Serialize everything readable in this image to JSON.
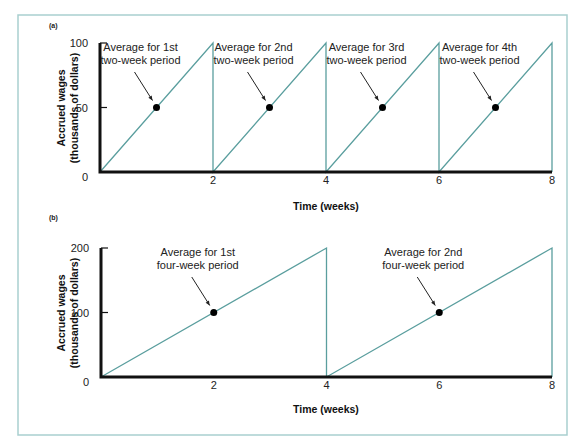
{
  "chart_data": [
    {
      "panel": "(a)",
      "type": "line",
      "title": "",
      "xlabel": "Time (weeks)",
      "ylabel": "Accrued wages (thousands of dollars)",
      "ylabel_line1": "Accrued wages",
      "ylabel_line2": "(thousands of dollars)",
      "xlim": [
        0,
        8
      ],
      "ylim": [
        0,
        100
      ],
      "x_ticks": [
        "2",
        "4",
        "6",
        "8"
      ],
      "y_ticks": [
        "0",
        "50",
        "100"
      ],
      "grid": false,
      "series": [
        {
          "name": "Accrued wages (sawtooth)",
          "x": [
            0,
            2,
            2,
            4,
            4,
            6,
            6,
            8,
            8
          ],
          "y": [
            0,
            100,
            0,
            100,
            0,
            100,
            0,
            100,
            0
          ]
        }
      ],
      "points": [
        {
          "x": 1,
          "y": 50,
          "label_line1": "Average for 1st",
          "label_line2": "two-week period"
        },
        {
          "x": 3,
          "y": 50,
          "label_line1": "Average for 2nd",
          "label_line2": "two-week period"
        },
        {
          "x": 5,
          "y": 50,
          "label_line1": "Average for 3rd",
          "label_line2": "two-week period"
        },
        {
          "x": 7,
          "y": 50,
          "label_line1": "Average for 4th",
          "label_line2": "two-week period"
        }
      ]
    },
    {
      "panel": "(b)",
      "type": "line",
      "title": "",
      "xlabel": "Time (weeks)",
      "ylabel": "Accrued wages (thousands of dollars)",
      "ylabel_line1": "Accrued wages",
      "ylabel_line2": "(thousands of dollars)",
      "xlim": [
        0,
        8
      ],
      "ylim": [
        0,
        200
      ],
      "x_ticks": [
        "2",
        "4",
        "6",
        "8"
      ],
      "y_ticks": [
        "0",
        "100",
        "200"
      ],
      "grid": false,
      "series": [
        {
          "name": "Accrued wages (sawtooth)",
          "x": [
            0,
            4,
            4,
            8,
            8
          ],
          "y": [
            0,
            200,
            0,
            200,
            0
          ]
        }
      ],
      "points": [
        {
          "x": 2,
          "y": 100,
          "label_line1": "Average for 1st",
          "label_line2": "four-week period"
        },
        {
          "x": 6,
          "y": 100,
          "label_line1": "Average for 2nd",
          "label_line2": "four-week period"
        }
      ]
    }
  ],
  "colors": {
    "line": "#5a9e9e",
    "frame": "#a9cfcf",
    "axis": "#111111"
  }
}
